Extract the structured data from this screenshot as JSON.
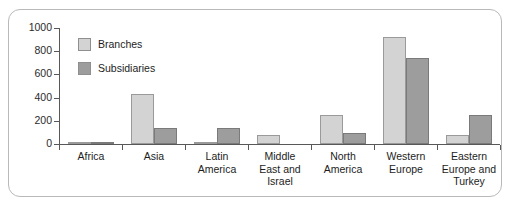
{
  "chart_data": {
    "type": "bar",
    "title": "",
    "xlabel": "",
    "ylabel": "",
    "ylim": [
      0,
      1000
    ],
    "yticks": [
      0,
      200,
      400,
      600,
      800,
      1000
    ],
    "ytick_labels": [
      "0",
      "200",
      "400",
      "600",
      "800",
      "1000"
    ],
    "grid": false,
    "legend_position": "top-left",
    "categories": [
      "Africa",
      "Asia",
      "Latin\nAmerica",
      "Middle\nEast and\nIsrael",
      "North\nAmerica",
      "Western\nEurope",
      "Eastern\nEurope and\nTurkey"
    ],
    "series": [
      {
        "name": "Branches",
        "color": "#d3d3d3",
        "values": [
          10,
          435,
          20,
          75,
          250,
          925,
          75
        ]
      },
      {
        "name": "Subsidiaries",
        "color": "#9d9d9d",
        "values": [
          10,
          135,
          140,
          0,
          95,
          745,
          250
        ]
      }
    ]
  },
  "legend": {
    "items": [
      {
        "label": "Branches",
        "swatch": "branches"
      },
      {
        "label": "Subsidiaries",
        "swatch": "subsidiaries"
      }
    ]
  },
  "colors": {
    "branches": "#d3d3d3",
    "subsidiaries": "#9d9d9d",
    "axis": "#58585a",
    "frame": "#b9b9b9",
    "text": "#1d1d1d"
  }
}
